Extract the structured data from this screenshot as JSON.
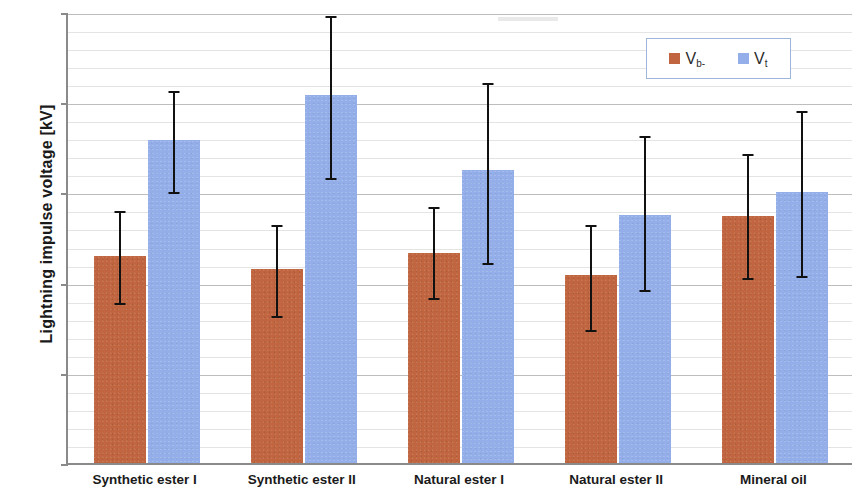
{
  "chart_data": {
    "type": "bar",
    "title": "",
    "xlabel": "",
    "ylabel": "Lightning impulse voltage [kV]",
    "ylim": [
      100,
      150
    ],
    "ytick_values": [
      100,
      110,
      120,
      130,
      140,
      150
    ],
    "ytick_labels": [
      "100",
      "110",
      "120",
      "130",
      "140",
      "150"
    ],
    "y_minor_step": 2,
    "grid": true,
    "grid_axis": "y",
    "legend_position": "top-right",
    "categories": [
      "Synthetic ester I",
      "Synthetic ester II",
      "Natural ester I",
      "Natural ester II",
      "Mineral oil"
    ],
    "series": [
      {
        "name": "Vb-",
        "label_base": "V",
        "label_sub": "b-",
        "color": "#C0653F",
        "values": [
          123.0,
          121.5,
          123.3,
          120.8,
          127.4
        ],
        "error_low": [
          117.7,
          116.3,
          118.3,
          114.8,
          120.5
        ],
        "error_high": [
          128.2,
          126.6,
          128.6,
          126.6,
          134.5
        ]
      },
      {
        "name": "Vt",
        "label_base": "V",
        "label_sub": "t",
        "color": "#93AEE8",
        "values": [
          135.8,
          140.8,
          132.5,
          127.5,
          130.0
        ],
        "error_low": [
          130.0,
          131.6,
          122.2,
          119.2,
          120.7
        ],
        "error_high": [
          141.5,
          149.8,
          142.3,
          136.5,
          139.2
        ]
      }
    ],
    "errorbar_color": "#111111",
    "axis_color": "#8A8A8A",
    "grid_major_color": "#BDBDBD",
    "grid_minor_color": "#E4E4E4",
    "background_color": "#FFFFFF"
  }
}
